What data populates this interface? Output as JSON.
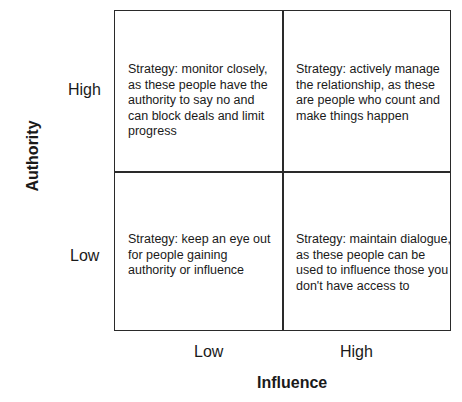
{
  "diagram": {
    "type": "2x2 matrix",
    "x_axis": {
      "title": "Influence",
      "ticks": [
        "Low",
        "High"
      ]
    },
    "y_axis": {
      "title": "Authority",
      "ticks": [
        "High",
        "Low"
      ]
    },
    "quadrants": {
      "high_authority_low_influence": "Strategy: monitor closely, as these people have the authority to say no and can block deals and limit progress",
      "high_authority_high_influence": "Strategy: actively manage the relationship, as these are people who count and make things happen",
      "low_authority_low_influence": "Strategy: keep an eye out for people gaining authority or influence",
      "low_authority_high_influence": "Strategy: maintain dialogue, as these people can be used to influence those you don't have access to"
    },
    "colors": {
      "line": "#2a2a2a",
      "text": "#1a1a1a",
      "background": "#ffffff"
    }
  }
}
